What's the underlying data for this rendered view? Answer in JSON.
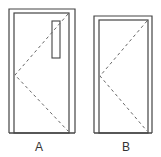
{
  "colors": {
    "line": "#444444",
    "dash": "#666666",
    "background": "#ffffff"
  },
  "doors": [
    {
      "id": "A",
      "label": "A",
      "has_vision_panel": true,
      "hinge_side": "left",
      "outer": {
        "x": 9,
        "y": 9,
        "w": 66,
        "h": 124
      },
      "inner": {
        "x": 14,
        "y": 13,
        "w": 55,
        "h": 120
      },
      "vision_panel": {
        "x": 52,
        "y": 21,
        "w": 8,
        "h": 37
      },
      "swing_apex": {
        "x": 15,
        "y": 75
      },
      "swing_top": {
        "x": 68,
        "y": 14
      },
      "swing_bottom": {
        "x": 68,
        "y": 131
      },
      "label_pos": {
        "x": 39,
        "y": 141
      }
    },
    {
      "id": "B",
      "label": "B",
      "has_vision_panel": false,
      "hinge_side": "left",
      "outer": {
        "x": 94,
        "y": 16,
        "w": 58,
        "h": 117
      },
      "inner": {
        "x": 99,
        "y": 20,
        "w": 49,
        "h": 113
      },
      "swing_apex": {
        "x": 100,
        "y": 76
      },
      "swing_top": {
        "x": 147,
        "y": 21
      },
      "swing_bottom": {
        "x": 147,
        "y": 131
      },
      "label_pos": {
        "x": 126,
        "y": 141
      }
    }
  ]
}
